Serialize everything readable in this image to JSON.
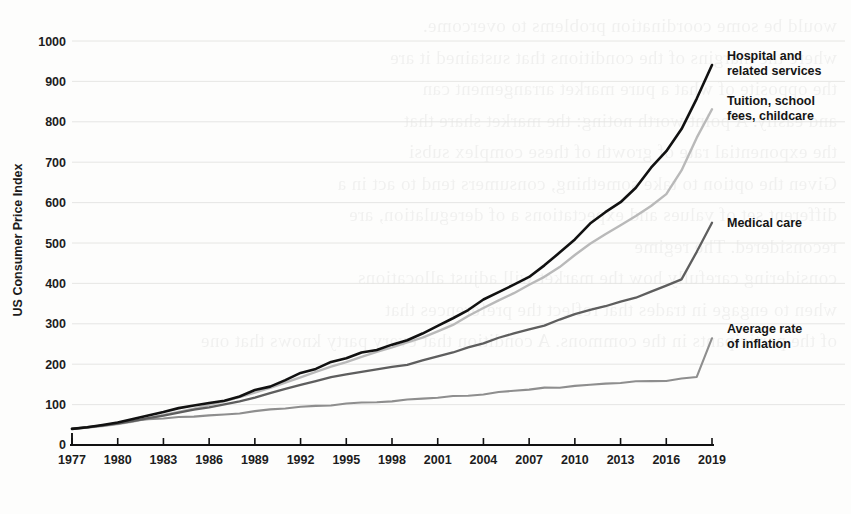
{
  "chart_data": {
    "type": "line",
    "title": "",
    "xlabel": "",
    "ylabel": "US Consumer Price Index",
    "xlim": [
      1977,
      2019
    ],
    "ylim": [
      0,
      1000
    ],
    "grid": true,
    "legend_position": "right-inline-labels",
    "y_ticks": [
      0,
      100,
      200,
      300,
      400,
      500,
      600,
      700,
      800,
      900,
      1000
    ],
    "x_ticks": [
      1977,
      1980,
      1983,
      1986,
      1989,
      1992,
      1995,
      1998,
      2001,
      2004,
      2007,
      2010,
      2013,
      2016,
      2019
    ],
    "x": [
      1977,
      1978,
      1979,
      1980,
      1981,
      1982,
      1983,
      1984,
      1985,
      1986,
      1987,
      1988,
      1989,
      1990,
      1991,
      1992,
      1993,
      1994,
      1995,
      1996,
      1997,
      1998,
      1999,
      2000,
      2001,
      2002,
      2003,
      2004,
      2005,
      2006,
      2007,
      2008,
      2009,
      2010,
      2011,
      2012,
      2013,
      2014,
      2015,
      2016,
      2017,
      2018,
      2019
    ],
    "series": [
      {
        "name": "Hospital and related services",
        "color": "#111111",
        "width": 2.6,
        "label_line1": "Hospital and",
        "label_line2": "related services",
        "end_value": 940,
        "values": [
          40,
          44,
          49,
          56,
          64,
          73,
          82,
          90,
          97,
          104,
          112,
          122,
          134,
          148,
          163,
          178,
          192,
          205,
          216,
          227,
          238,
          249,
          261,
          275,
          291,
          312,
          334,
          355,
          375,
          396,
          421,
          447,
          474,
          508,
          545,
          577,
          606,
          641,
          686,
          730,
          783,
          862,
          940
        ]
      },
      {
        "name": "Tuition, school fees, childcare",
        "color": "#b9b9b9",
        "width": 2.4,
        "label_line1": "Tuition, school",
        "label_line2": "fees, childcare",
        "end_value": 830,
        "values": [
          40,
          43,
          47,
          52,
          58,
          66,
          74,
          82,
          90,
          99,
          108,
          118,
          129,
          141,
          154,
          168,
          181,
          194,
          206,
          218,
          230,
          241,
          253,
          265,
          280,
          298,
          318,
          338,
          357,
          376,
          396,
          416,
          440,
          470,
          498,
          521,
          543,
          566,
          592,
          620,
          680,
          760,
          830
        ]
      },
      {
        "name": "Medical care",
        "color": "#5e5e5e",
        "width": 2.3,
        "label_line1": "Medical care",
        "label_line2": "",
        "end_value": 550,
        "values": [
          40,
          44,
          48,
          53,
          59,
          66,
          73,
          80,
          87,
          93,
          100,
          108,
          117,
          128,
          139,
          150,
          159,
          167,
          175,
          182,
          188,
          194,
          200,
          208,
          218,
          229,
          241,
          253,
          264,
          275,
          286,
          297,
          310,
          324,
          335,
          345,
          354,
          365,
          378,
          393,
          410,
          478,
          550
        ]
      },
      {
        "name": "Average rate of inflation",
        "color": "#8e8e8e",
        "width": 2.1,
        "label_line1": "Average rate",
        "label_line2": "of inflation",
        "end_value": 265,
        "values": [
          40,
          43,
          48,
          55,
          60,
          64,
          66,
          69,
          71,
          73,
          76,
          79,
          83,
          87,
          91,
          94,
          96,
          99,
          102,
          105,
          107,
          109,
          111,
          115,
          118,
          120,
          123,
          126,
          130,
          134,
          138,
          143,
          143,
          145,
          150,
          153,
          155,
          158,
          158,
          160,
          163,
          167,
          265
        ]
      }
    ]
  },
  "axis": {
    "ylabel": "US Consumer Price Index",
    "origin_label": "0"
  },
  "paper": {
    "bleed_text": "would be some coordination problems to overcome.\nwhere the margins of the conditions that sustained it are\nthe opposite of what a pure market arrangement can\nand easily. A point worth noting: the market share that\nthe exponential rate of growth of these complex subsi\nGiven the option to take something, consumers tend to act in a\ndifferent set of values and expectations a of deregulation, are\nreconsidered. The regime\nconsidering carefully how the market will adjust allocations\nwhen to engage in trades that reflect the preferences that\nof the participants in the commons. A condition that every party knows that one"
  }
}
